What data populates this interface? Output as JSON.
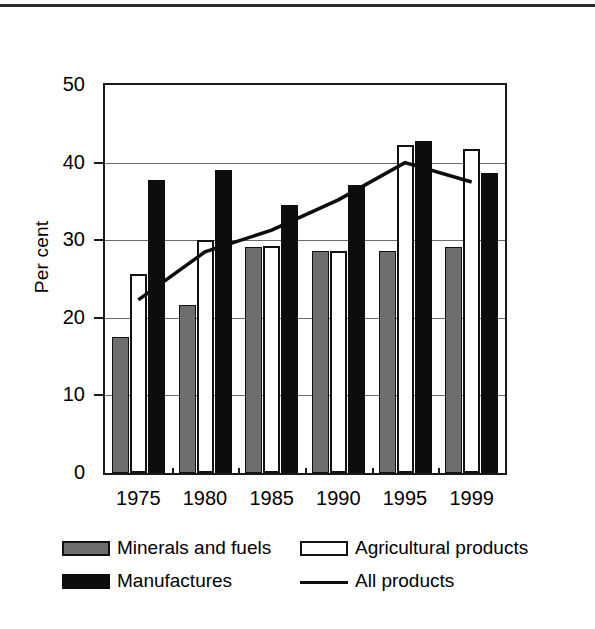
{
  "figure": {
    "ylabel": "Per cent"
  },
  "chart_data": {
    "type": "bar",
    "title": "",
    "xlabel": "",
    "ylabel": "Per cent",
    "categories": [
      "1975",
      "1980",
      "1985",
      "1990",
      "1995",
      "1999"
    ],
    "ylim": [
      0,
      50
    ],
    "yticks": [
      0,
      10,
      20,
      30,
      40,
      50
    ],
    "ytick_labels": [
      "0",
      "10",
      "20",
      "30",
      "40",
      "50"
    ],
    "grid": true,
    "legend_position": "bottom",
    "series": [
      {
        "name": "Minerals and fuels",
        "type": "bar",
        "color": "#6e6e6e",
        "values": [
          17.5,
          21.7,
          29.1,
          28.6,
          28.6,
          29.1
        ]
      },
      {
        "name": "Agricultural products",
        "type": "bar",
        "color": "#ffffff",
        "values": [
          25.6,
          30.0,
          29.3,
          28.6,
          42.3,
          41.7
        ]
      },
      {
        "name": "Manufactures",
        "type": "bar",
        "color": "#0d0d0d",
        "values": [
          37.7,
          39.1,
          34.5,
          37.1,
          42.8,
          38.7
        ]
      },
      {
        "name": "All products",
        "type": "line",
        "color": "#0d0d0d",
        "values": [
          22.3,
          28.5,
          31.3,
          35.2,
          40.0,
          37.5
        ]
      }
    ]
  },
  "legend": {
    "items": [
      {
        "label": "Minerals and fuels",
        "marker": "gray-square-swatch"
      },
      {
        "label": "Agricultural products",
        "marker": "white-square-swatch"
      },
      {
        "label": "Manufactures",
        "marker": "black-square-swatch"
      },
      {
        "label": "All products",
        "marker": "black-line-swatch"
      }
    ]
  }
}
